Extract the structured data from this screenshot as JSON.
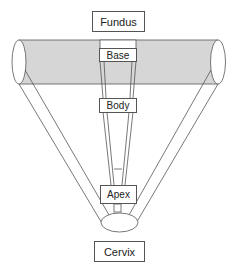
{
  "diagram": {
    "labels": {
      "fundus": "Fundus",
      "base": "Base",
      "body": "Body",
      "apex": "Apex",
      "cervix": "Cervix"
    },
    "colors": {
      "tube_fill": "#d6d6d6",
      "stroke": "#555555",
      "background": "#ffffff"
    }
  }
}
